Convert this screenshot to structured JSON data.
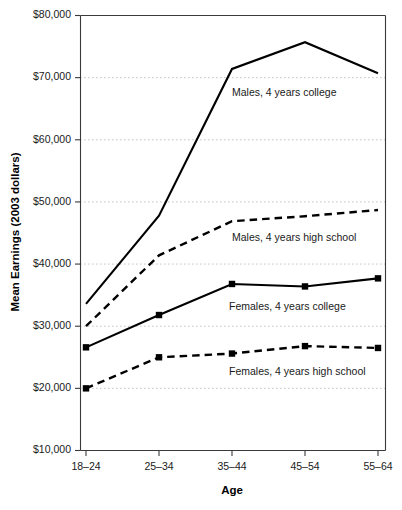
{
  "chart_data": {
    "type": "line",
    "title": "",
    "xlabel": "Age",
    "ylabel": "Mean Earnings (2003 dollars)",
    "categories": [
      "18–24",
      "25–34",
      "35–44",
      "45–54",
      "55–64"
    ],
    "ylim": [
      10000,
      80000
    ],
    "ytick_values": [
      10000,
      20000,
      30000,
      40000,
      50000,
      60000,
      70000,
      80000
    ],
    "ytick_labels": [
      "$10,000",
      "$20,000",
      "$30,000",
      "$40,000",
      "$50,000",
      "$60,000",
      "$70,000",
      "$80,000"
    ],
    "grid": true,
    "grid_axis": "y",
    "legend_position": "inline-annotations",
    "series": [
      {
        "name": "Males, 4 years college",
        "style": "solid",
        "markers": false,
        "values": [
          33600,
          47800,
          71400,
          75700,
          70700
        ],
        "annotation": "Males, 4 years college"
      },
      {
        "name": "Males, 4 years high school",
        "style": "dashed",
        "markers": false,
        "values": [
          30000,
          41400,
          46900,
          47700,
          48700
        ],
        "annotation": "Males, 4 years high school"
      },
      {
        "name": "Females, 4 years college",
        "style": "solid",
        "markers": true,
        "values": [
          26600,
          31800,
          36800,
          36400,
          37700
        ],
        "annotation": "Females, 4 years college"
      },
      {
        "name": "Females, 4 years high school",
        "style": "dashed",
        "markers": true,
        "values": [
          20000,
          25000,
          25600,
          26800,
          26500
        ],
        "annotation": "Females, 4 years high school"
      }
    ],
    "colors": {
      "line": "#000000",
      "grid": "#bdbdbd",
      "axis": "#3a3a3a",
      "text": "#1a1a1a",
      "background": "#ffffff"
    }
  },
  "annotations": [
    {
      "text": "Males, 4 years college",
      "x": 232,
      "y": 96
    },
    {
      "text": "Males, 4 years high school",
      "x": 232,
      "y": 241
    },
    {
      "text": "Females, 4 years college",
      "x": 229,
      "y": 310
    },
    {
      "text": "Females, 4 years high school",
      "x": 229,
      "y": 375
    }
  ]
}
